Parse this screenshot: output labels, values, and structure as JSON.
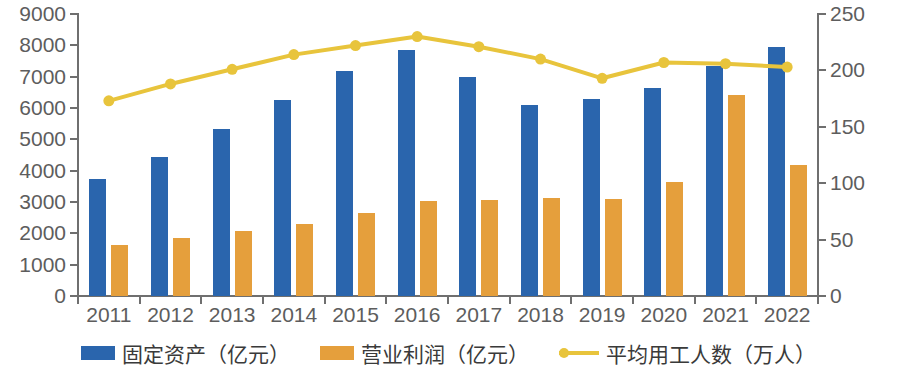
{
  "chart_data": {
    "type": "bar",
    "title": "",
    "xlabel": "",
    "ylabel": "",
    "categories": [
      "2011",
      "2012",
      "2013",
      "2014",
      "2015",
      "2016",
      "2017",
      "2018",
      "2019",
      "2020",
      "2021",
      "2022"
    ],
    "ylim": [
      0,
      9000
    ],
    "y2lim": [
      0,
      250
    ],
    "yticks": [
      0,
      1000,
      2000,
      3000,
      4000,
      5000,
      6000,
      7000,
      8000,
      9000
    ],
    "y2ticks": [
      0,
      50,
      100,
      150,
      200,
      250
    ],
    "grid": false,
    "legend_position": "bottom",
    "series": [
      {
        "name": "固定资产（亿元）",
        "type": "bar",
        "axis": "left",
        "color": "#2a65ad",
        "values": [
          3750,
          4430,
          5330,
          6250,
          7190,
          7850,
          6980,
          6100,
          6280,
          6640,
          7350,
          7940
        ]
      },
      {
        "name": "营业利润（亿元）",
        "type": "bar",
        "axis": "left",
        "color": "#e59f3c",
        "values": [
          1620,
          1840,
          2080,
          2300,
          2650,
          3030,
          3070,
          3120,
          3110,
          3640,
          6400,
          4180
        ]
      },
      {
        "name": "平均用工人数（万人）",
        "type": "line",
        "axis": "right",
        "color": "#e8c43c",
        "values": [
          173,
          188,
          201,
          214,
          222,
          230,
          221,
          210,
          193,
          207,
          206,
          203
        ]
      }
    ]
  },
  "legend": {
    "items": [
      {
        "label": "固定资产（亿元）",
        "marker": "square",
        "color": "#2a65ad"
      },
      {
        "label": "营业利润（亿元）",
        "marker": "square",
        "color": "#e59f3c"
      },
      {
        "label": "平均用工人数（万人）",
        "marker": "line-dot",
        "color": "#e8c43c"
      }
    ]
  }
}
